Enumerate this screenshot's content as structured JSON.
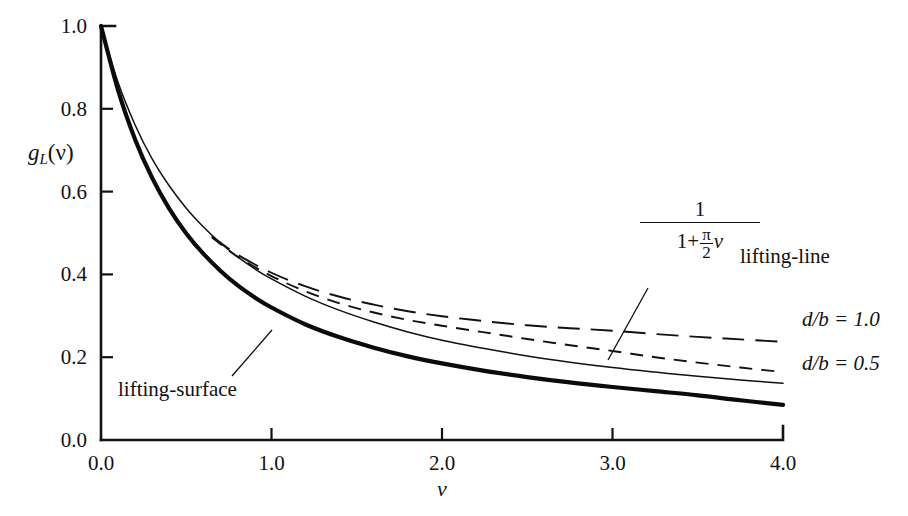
{
  "figure": {
    "background": "#ffffff",
    "ink_color": "#111111"
  },
  "axes": {
    "y_label_main": "g",
    "y_label_sub": "L",
    "y_label_arg": "(ν)",
    "x_label": "ν",
    "x_ticks": [
      "0.0",
      "1.0",
      "2.0",
      "3.0",
      "4.0"
    ],
    "y_ticks": [
      "0.0",
      "0.2",
      "0.4",
      "0.6",
      "0.8",
      "1.0"
    ]
  },
  "annotations": {
    "lifting_line": "lifting-line",
    "lifting_surface": "lifting-surface",
    "db_10": "d/b = 1.0",
    "db_05": "d/b = 0.5",
    "formula_num": "1",
    "formula_den_lead": "1+",
    "formula_den_pi": "π",
    "formula_den_two": "2",
    "formula_den_nu": "ν"
  },
  "chart_data": {
    "type": "line",
    "title": "",
    "xlabel": "ν",
    "ylabel": "g_L(ν)",
    "xlim": [
      0.0,
      4.0
    ],
    "ylim": [
      0.0,
      1.0
    ],
    "xticks": [
      0.0,
      1.0,
      2.0,
      3.0,
      4.0
    ],
    "yticks": [
      0.0,
      0.2,
      0.4,
      0.6,
      0.8,
      1.0
    ],
    "grid": false,
    "legend": "inline-annotations",
    "series": [
      {
        "name": "lifting-line  1/(1+(π/2)ν)",
        "style": "thin-solid",
        "x": [
          0.0,
          0.1,
          0.2,
          0.3,
          0.4,
          0.5,
          0.6,
          0.7,
          0.8,
          0.9,
          1.0,
          1.2,
          1.4,
          1.6,
          1.8,
          2.0,
          2.25,
          2.5,
          2.75,
          3.0,
          3.25,
          3.5,
          3.75,
          4.0
        ],
        "y": [
          1.0,
          0.864,
          0.761,
          0.679,
          0.614,
          0.56,
          0.515,
          0.476,
          0.443,
          0.414,
          0.389,
          0.347,
          0.313,
          0.285,
          0.261,
          0.241,
          0.221,
          0.203,
          0.188,
          0.175,
          0.164,
          0.154,
          0.145,
          0.137
        ]
      },
      {
        "name": "lifting-surface",
        "style": "thick-solid",
        "x": [
          0.0,
          0.1,
          0.2,
          0.3,
          0.4,
          0.5,
          0.6,
          0.7,
          0.8,
          0.9,
          1.0,
          1.2,
          1.4,
          1.6,
          1.8,
          2.0,
          2.25,
          2.5,
          2.75,
          3.0,
          3.25,
          3.5,
          3.75,
          4.0
        ],
        "y": [
          1.0,
          0.845,
          0.726,
          0.633,
          0.559,
          0.499,
          0.45,
          0.409,
          0.374,
          0.345,
          0.32,
          0.279,
          0.248,
          0.223,
          0.202,
          0.185,
          0.167,
          0.152,
          0.139,
          0.128,
          0.118,
          0.108,
          0.096,
          0.085
        ]
      },
      {
        "name": "d/b = 1.0",
        "style": "long-dash",
        "x": [
          0.65,
          0.8,
          1.0,
          1.2,
          1.4,
          1.6,
          1.8,
          2.0,
          2.25,
          2.5,
          2.75,
          3.0,
          3.25,
          3.5,
          3.75,
          4.0
        ],
        "y": [
          0.492,
          0.448,
          0.404,
          0.371,
          0.346,
          0.327,
          0.311,
          0.299,
          0.287,
          0.277,
          0.27,
          0.264,
          0.256,
          0.249,
          0.243,
          0.237
        ]
      },
      {
        "name": "d/b = 0.5",
        "style": "short-dash",
        "x": [
          0.65,
          0.8,
          1.0,
          1.2,
          1.4,
          1.6,
          1.8,
          2.0,
          2.25,
          2.5,
          2.75,
          3.0,
          3.25,
          3.5,
          3.75,
          4.0
        ],
        "y": [
          0.49,
          0.443,
          0.396,
          0.359,
          0.33,
          0.308,
          0.29,
          0.276,
          0.26,
          0.244,
          0.229,
          0.215,
          0.2,
          0.187,
          0.175,
          0.164
        ]
      }
    ]
  }
}
